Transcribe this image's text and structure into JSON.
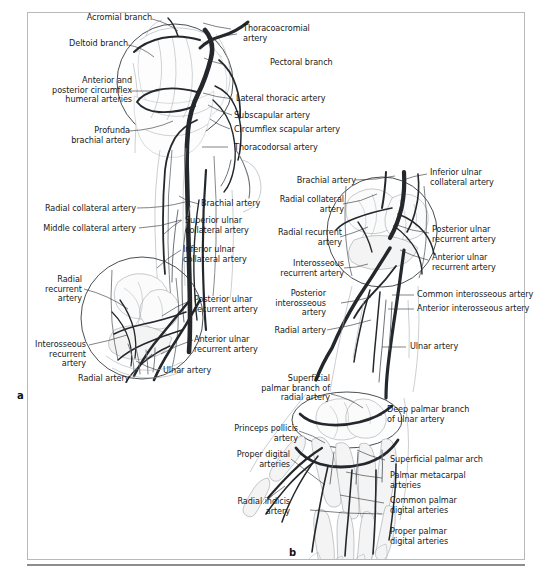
{
  "figure": {
    "panels": [
      {
        "id": "a",
        "caption": "a"
      },
      {
        "id": "b",
        "caption": "b"
      }
    ]
  },
  "colors": {
    "frame_border": "#b9b9b9",
    "text": "#16191c",
    "leader_line": "#2b2f33",
    "vessel_dark": "#24282c",
    "vessel_light": "#6d7379",
    "bone_fill": "#fbfbfb",
    "background": "#ffffff"
  },
  "panel_a": {
    "labels": [
      {
        "text": "Acromial branch",
        "align": "right"
      },
      {
        "text": "Deltoid branch",
        "align": "right"
      },
      {
        "text": "Anterior and\nposterior circumflex\nhumeral arteries",
        "align": "right"
      },
      {
        "text": "Profunda\nbrachial artery",
        "align": "right"
      },
      {
        "text": "Radial collateral artery",
        "align": "right"
      },
      {
        "text": "Middle collateral artery",
        "align": "right"
      },
      {
        "text": "Radial\nrecurrent\nartery",
        "align": "right"
      },
      {
        "text": "Interosseous\nrecurrent\nartery",
        "align": "right"
      },
      {
        "text": "Radial artery",
        "align": "right"
      },
      {
        "text": "Thoracoacromial\nartery",
        "align": "left"
      },
      {
        "text": "Pectoral branch",
        "align": "left"
      },
      {
        "text": "Lateral thoracic artery",
        "align": "left"
      },
      {
        "text": "Subscapular artery",
        "align": "left"
      },
      {
        "text": "Circumflex scapular artery",
        "align": "left"
      },
      {
        "text": "Thoracodorsal artery",
        "align": "left"
      },
      {
        "text": "Brachial artery",
        "align": "left"
      },
      {
        "text": "Superior ulnar\ncollateral artery",
        "align": "left"
      },
      {
        "text": "Inferior ulnar\ncollateral artery",
        "align": "left"
      },
      {
        "text": "Posterior ulnar\nrecurrent artery",
        "align": "left"
      },
      {
        "text": "Anterior ulnar\nrecurrent artery",
        "align": "left"
      },
      {
        "text": "Ulnar artery",
        "align": "left"
      }
    ]
  },
  "panel_b": {
    "labels": [
      {
        "text": "Brachial artery",
        "align": "right"
      },
      {
        "text": "Radial collateral\nartery",
        "align": "right"
      },
      {
        "text": "Radial recurrent\nartery",
        "align": "right"
      },
      {
        "text": "Interosseous\nrecurrent artery",
        "align": "right"
      },
      {
        "text": "Posterior\ninterosseous\nartery",
        "align": "right"
      },
      {
        "text": "Radial artery",
        "align": "right"
      },
      {
        "text": "Superficial\npalmar branch of\nradial artery",
        "align": "right"
      },
      {
        "text": "Princeps pollicis\nartery",
        "align": "right"
      },
      {
        "text": "Proper digital\narteries",
        "align": "right"
      },
      {
        "text": "Radial indicis\nartery",
        "align": "right"
      },
      {
        "text": "Inferior ulnar\ncollateral artery",
        "align": "left"
      },
      {
        "text": "Posterior ulnar\nrecurrent artery",
        "align": "left"
      },
      {
        "text": "Anterior ulnar\nrecurrent artery",
        "align": "left"
      },
      {
        "text": "Common interosseous artery",
        "align": "left"
      },
      {
        "text": "Anterior interosseous artery",
        "align": "left"
      },
      {
        "text": "Ulnar artery",
        "align": "left"
      },
      {
        "text": "Deep palmar branch\nof ulnar artery",
        "align": "left"
      },
      {
        "text": "Superficial palmar arch",
        "align": "left"
      },
      {
        "text": "Palmar metacarpal\narteries",
        "align": "left"
      },
      {
        "text": "Common palmar\ndigital arteries",
        "align": "left"
      },
      {
        "text": "Proper palmar\ndigital arteries",
        "align": "left"
      }
    ]
  }
}
